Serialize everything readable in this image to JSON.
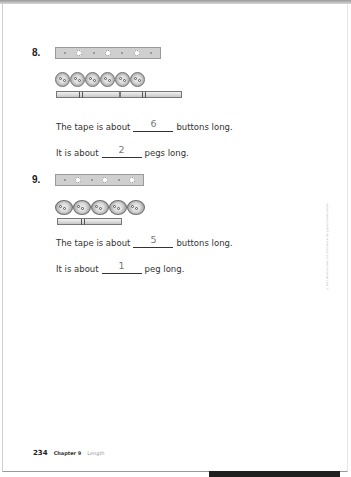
{
  "page": {
    "number": "234",
    "chapter": "Chapter 9",
    "topic": "Length",
    "copyright": "© 2011 Marshall Cavendish International (Singapore) Private Limited"
  },
  "problems": [
    {
      "number": "8.",
      "strip_holes": 3,
      "buttons_count": 6,
      "pegs_count": 2,
      "sentence1": {
        "prefix": "The tape is about",
        "answer": "6",
        "suffix": "buttons long."
      },
      "sentence2": {
        "prefix": "It is about",
        "answer": "2",
        "suffix": "pegs long."
      }
    },
    {
      "number": "9.",
      "strip_holes": 3,
      "buttons_count": 5,
      "pegs_count": 1,
      "sentence1": {
        "prefix": "The tape is about",
        "answer": "5",
        "suffix": "buttons long."
      },
      "sentence2": {
        "prefix": "It is about",
        "answer": "1",
        "suffix": "peg long."
      }
    }
  ]
}
